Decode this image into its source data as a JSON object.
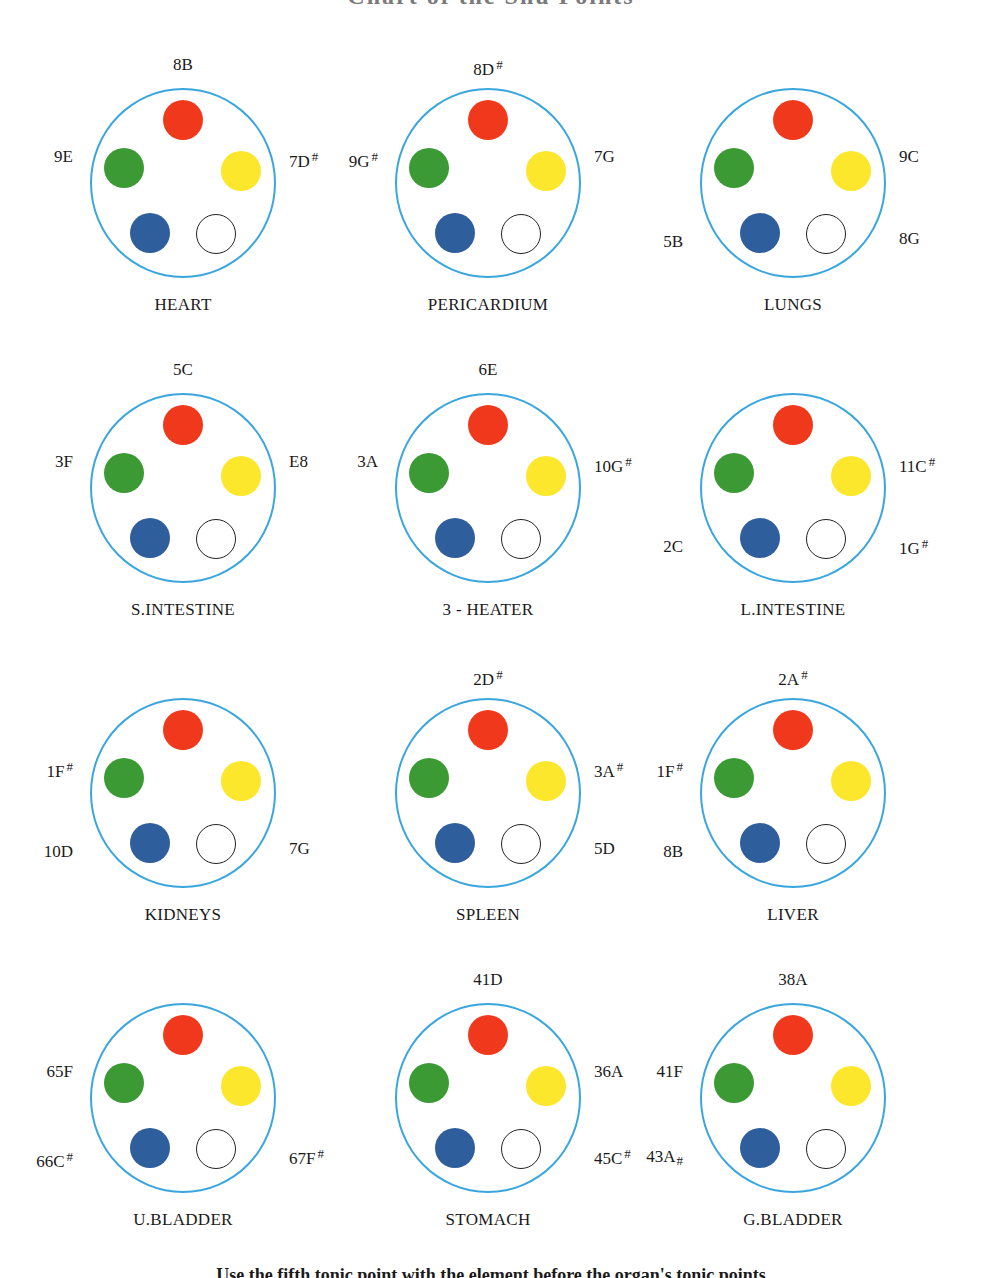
{
  "header": {
    "title": "Chart of the Shu Points"
  },
  "colors": {
    "ring": "#3aa6dd",
    "fire": "#f0391c",
    "wood": "#3b9a34",
    "earth": "#fce72c",
    "water": "#2f5e9c",
    "metal_fill": "#ffffff",
    "metal_stroke": "#222222"
  },
  "legend_dots": [
    "red",
    "green",
    "yellow",
    "blue",
    "white-outline"
  ],
  "organs": [
    {
      "name": "HEART",
      "x": 183,
      "y": 183,
      "labels": {
        "top": "8B",
        "left": "9E",
        "right": "7D",
        "bottom_left": "",
        "bottom_right": ""
      },
      "marks": {
        "top": "",
        "left": "",
        "right": "#",
        "bottom_left": "",
        "bottom_right": ""
      }
    },
    {
      "name": "PERICARDIUM",
      "x": 488,
      "y": 183,
      "labels": {
        "top": "8D",
        "left": "9G",
        "right": "7G",
        "bottom_left": "",
        "bottom_right": ""
      },
      "marks": {
        "top": "#",
        "left": "#",
        "right": "",
        "bottom_left": "",
        "bottom_right": ""
      }
    },
    {
      "name": "LUNGS",
      "x": 793,
      "y": 183,
      "labels": {
        "top": "",
        "left": "",
        "right": "9C",
        "bottom_left": "5B",
        "bottom_right": "8G"
      },
      "marks": {
        "top": "",
        "left": "",
        "right": "",
        "bottom_left": "",
        "bottom_right": ""
      }
    },
    {
      "name": "S.INTESTINE",
      "x": 183,
      "y": 488,
      "labels": {
        "top": "5C",
        "left": "3F",
        "right": "E8",
        "bottom_left": "",
        "bottom_right": ""
      },
      "marks": {
        "top": "",
        "left": "",
        "right": "",
        "bottom_left": "",
        "bottom_right": ""
      }
    },
    {
      "name": "3 - HEATER",
      "x": 488,
      "y": 488,
      "labels": {
        "top": "6E",
        "left": "3A",
        "right": "10G",
        "bottom_left": "",
        "bottom_right": ""
      },
      "marks": {
        "top": "",
        "left": "",
        "right": "#",
        "bottom_left": "",
        "bottom_right": ""
      }
    },
    {
      "name": "L.INTESTINE",
      "x": 793,
      "y": 488,
      "labels": {
        "top": "",
        "left": "",
        "right": "11C",
        "bottom_left": "2C",
        "bottom_right": "1G"
      },
      "marks": {
        "top": "",
        "left": "",
        "right": "#",
        "bottom_left": "",
        "bottom_right": "#"
      }
    },
    {
      "name": "KIDNEYS",
      "x": 183,
      "y": 793,
      "labels": {
        "top": "",
        "left": "1F",
        "right": "",
        "bottom_left": "10D",
        "bottom_right": "7G"
      },
      "marks": {
        "top": "",
        "left": "#",
        "right": "",
        "bottom_left": "",
        "bottom_right": ""
      }
    },
    {
      "name": "SPLEEN",
      "x": 488,
      "y": 793,
      "labels": {
        "top": "2D",
        "left": "",
        "right": "3A",
        "bottom_left": "",
        "bottom_right": "5D"
      },
      "marks": {
        "top": "#",
        "left": "",
        "right": "#",
        "bottom_left": "",
        "bottom_right": ""
      }
    },
    {
      "name": "LIVER",
      "x": 793,
      "y": 793,
      "labels": {
        "top": "2A",
        "left": "1F",
        "right": "",
        "bottom_left": "8B",
        "bottom_right": ""
      },
      "marks": {
        "top": "#",
        "left": "#",
        "right": "",
        "bottom_left": "",
        "bottom_right": ""
      }
    },
    {
      "name": "U.BLADDER",
      "x": 183,
      "y": 1098,
      "labels": {
        "top": "",
        "left": "65F",
        "right": "",
        "bottom_left": "66C",
        "bottom_right": "67F"
      },
      "marks": {
        "top": "",
        "left": "",
        "right": "",
        "bottom_left": "#",
        "bottom_right": "#"
      }
    },
    {
      "name": "STOMACH",
      "x": 488,
      "y": 1098,
      "labels": {
        "top": "41D",
        "left": "",
        "right": "36A",
        "bottom_left": "",
        "bottom_right": "45C"
      },
      "marks": {
        "top": "",
        "left": "",
        "right": "",
        "bottom_left": "",
        "bottom_right": "#"
      }
    },
    {
      "name": "G.BLADDER",
      "x": 793,
      "y": 1098,
      "labels": {
        "top": "38A",
        "left": "41F",
        "right": "",
        "bottom_left": "43A",
        "bottom_right": ""
      },
      "marks": {
        "top": "",
        "left": "",
        "right": "",
        "bottom_left": "#",
        "bottom_right": ""
      }
    }
  ],
  "footer": {
    "text": "Use the fifth tonic point with the element before the organ's tonic points"
  }
}
